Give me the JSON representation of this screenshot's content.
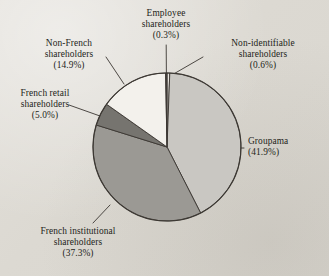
{
  "figure": {
    "background_color": "#dfdcd6",
    "text_color": "#241f1a",
    "stroke_color": "#3b3732"
  },
  "chart_data": {
    "type": "pie",
    "title": "",
    "subtitle": "",
    "xlabel": "",
    "ylabel": "",
    "legend": "none (labels with leader lines)",
    "grid": false,
    "start_angle_deg": 90,
    "direction": "clockwise",
    "units": "percent",
    "categories": [
      "Non-identifiable shareholders",
      "Groupama",
      "French institutional shareholders",
      "French retail shareholders",
      "Non-French shareholders",
      "Employee shareholders"
    ],
    "values": [
      0.6,
      41.9,
      37.3,
      5.0,
      14.9,
      0.3
    ],
    "colors": [
      "#e8e5df",
      "#c9c7c2",
      "#9b9994",
      "#76746f",
      "#f3f1ec",
      "#4a4744"
    ],
    "slices": [
      {
        "name": "Non-identifiable shareholders",
        "label_line1": "Non-identifiable",
        "label_line2": "shareholders",
        "value": 0.6,
        "percent_label": "(0.6%)",
        "color": "#e8e5df"
      },
      {
        "name": "Groupama",
        "label_line1": "Groupama",
        "label_line2": "",
        "value": 41.9,
        "percent_label": "(41.9%)",
        "color": "#c9c7c2"
      },
      {
        "name": "French institutional shareholders",
        "label_line1": "French institutional",
        "label_line2": "shareholders",
        "value": 37.3,
        "percent_label": "(37.3%)",
        "color": "#9b9994"
      },
      {
        "name": "French retail shareholders",
        "label_line1": "French retail",
        "label_line2": "shareholders",
        "value": 5.0,
        "percent_label": "(5.0%)",
        "color": "#76746f"
      },
      {
        "name": "Non-French shareholders",
        "label_line1": "Non-French",
        "label_line2": "shareholders",
        "value": 14.9,
        "percent_label": "(14.9%)",
        "color": "#f3f1ec"
      },
      {
        "name": "Employee shareholders",
        "label_line1": "Employee",
        "label_line2": "shareholders",
        "value": 0.3,
        "percent_label": "(0.3%)",
        "color": "#4a4744"
      }
    ],
    "total": 100.0
  },
  "labels": {
    "employee": {
      "line1": "Employee",
      "line2": "shareholders",
      "pct": "(0.3%)"
    },
    "non_identifiable": {
      "line1": "Non-identifiable",
      "line2": "shareholders",
      "pct": "(0.6%)"
    },
    "non_french": {
      "line1": "Non-French",
      "line2": "shareholders",
      "pct": "(14.9%)"
    },
    "french_retail": {
      "line1": "French retail",
      "line2": "shareholders",
      "pct": "(5.0%)"
    },
    "french_institutional": {
      "line1": "French institutional",
      "line2": "shareholders",
      "pct": "(37.3%)"
    },
    "groupama": {
      "line1": "Groupama",
      "line2": "",
      "pct": "(41.9%)"
    }
  }
}
